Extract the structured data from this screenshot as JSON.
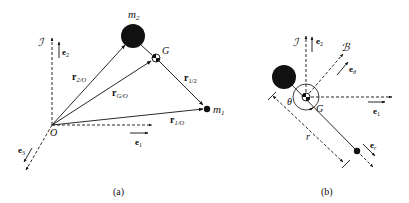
{
  "figure": {
    "panel_a": {
      "caption": "(a)",
      "origin_label": "O",
      "frame_label": "ℐ",
      "mass2_label": "m",
      "mass2_sub": "2",
      "mass1_label": "m",
      "mass1_sub": "1",
      "com_label": "G",
      "vectors": {
        "r2O": {
          "main": "r",
          "sub": "2/O"
        },
        "rGO": {
          "main": "r",
          "sub": "G/O"
        },
        "r1O": {
          "main": "r",
          "sub": "1/O"
        },
        "r12": {
          "main": "r",
          "sub": "1/2"
        }
      },
      "basis": {
        "e1": {
          "main": "e",
          "sub": "1"
        },
        "e2": {
          "main": "e",
          "sub": "2"
        },
        "e3": {
          "main": "e",
          "sub": "3"
        }
      }
    },
    "panel_b": {
      "caption": "(b)",
      "frame_I_label": "ℐ",
      "frame_B_label": "ℬ",
      "com_label": "G",
      "angle_label": "θ",
      "distance_label": "r",
      "basis": {
        "e1": {
          "main": "e",
          "sub": "1"
        },
        "e2": {
          "main": "e",
          "sub": "2"
        },
        "etheta": {
          "main": "e",
          "sub": "θ"
        },
        "er": {
          "main": "e",
          "sub": "r"
        }
      }
    }
  },
  "colors": {
    "ink": "#111111",
    "background": "#ffffff"
  }
}
